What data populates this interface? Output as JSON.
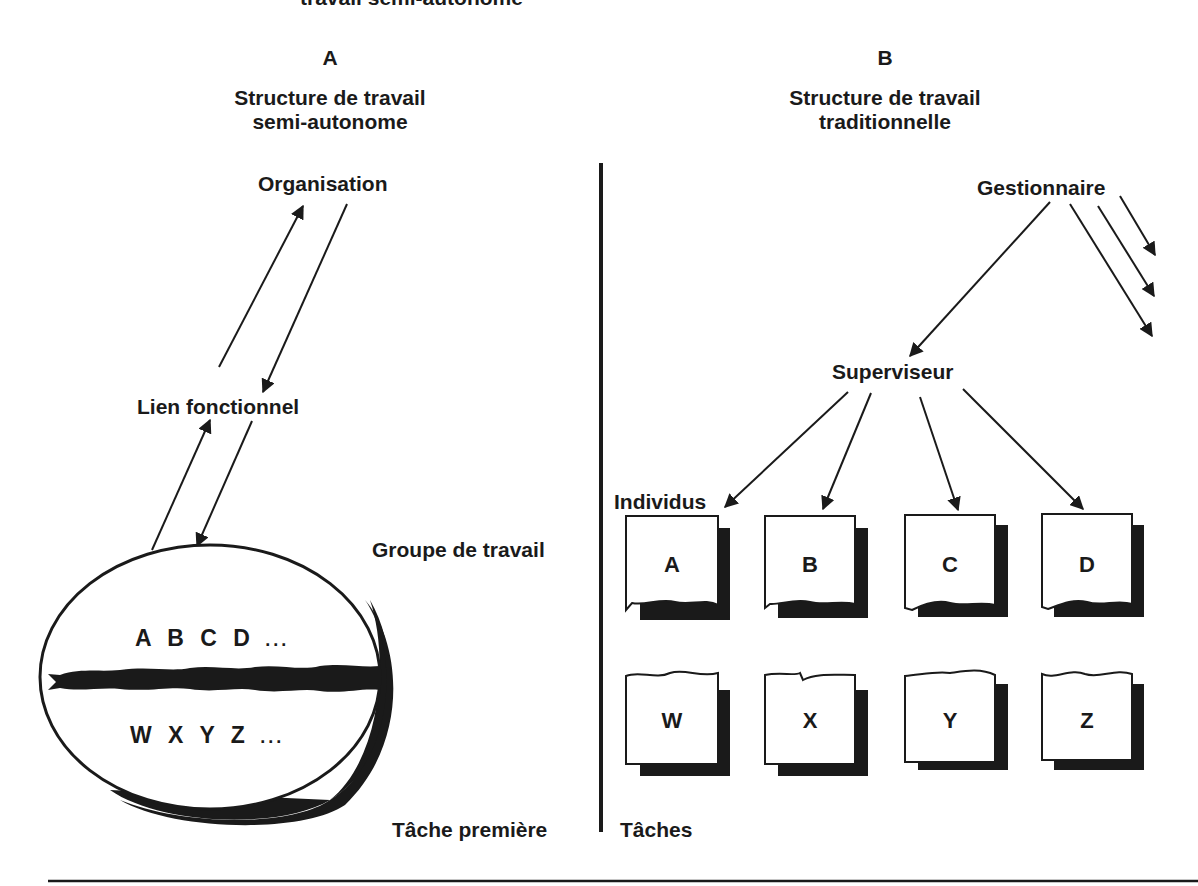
{
  "figure": {
    "cut_title": "travail semi-autonome",
    "footer_rule": true
  },
  "panel_a": {
    "letter": "A",
    "title_line1": "Structure de travail",
    "title_line2": "semi-autonome",
    "nodes": {
      "organisation": "Organisation",
      "lien_fonctionnel": "Lien fonctionnel",
      "groupe_de_travail": "Groupe de travail",
      "tache_premiere": "Tâche première"
    },
    "ellipse": {
      "top_text": "A B C D",
      "top_ellipsis": "...",
      "bottom_text": "W X Y Z",
      "bottom_ellipsis": "..."
    }
  },
  "panel_b": {
    "letter": "B",
    "title_line1": "Structure de travail",
    "title_line2": "traditionnelle",
    "nodes": {
      "gestionnaire": "Gestionnaire",
      "superviseur": "Superviseur",
      "individus": "Individus",
      "taches": "Tâches"
    },
    "individual_boxes": [
      "A",
      "B",
      "C",
      "D"
    ],
    "task_boxes": [
      "W",
      "X",
      "Y",
      "Z"
    ]
  }
}
